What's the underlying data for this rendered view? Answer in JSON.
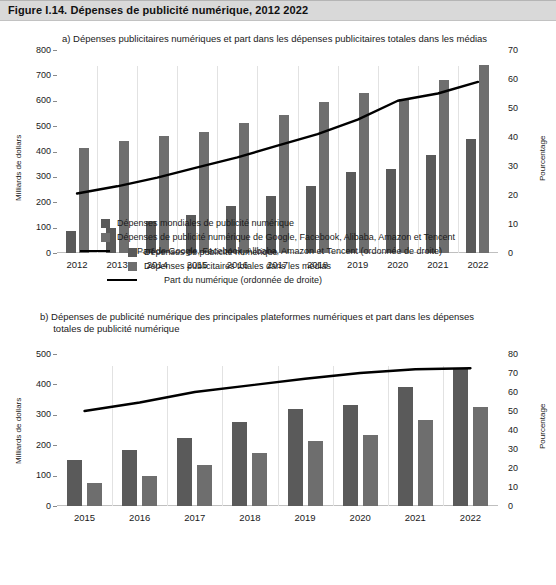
{
  "figure": {
    "title": "Figure I.14.  Dépenses de publicité numérique, 2012 2022"
  },
  "panel_a": {
    "subtitle": "a) Dépenses publicitaires numériques et part dans les dépenses publicitaires totales dans les médias",
    "y_left_title": "Milliards de dollars",
    "y_right_title": "Pourcentage",
    "legend": [
      "Dépenses de publicité numérique",
      "Dépenses publicitaires totales dans les médias",
      "Part du numérique (ordonnée de droite)"
    ]
  },
  "panel_b": {
    "subtitle": "b) Dépenses de publicité numérique des principales plateformes numériques et part dans les dépenses\n     totales de publicité numérique",
    "y_left_title": "Milliards de dollars",
    "y_right_title": "Pourcentage",
    "legend": [
      "Dépenses mondiales de publicité numérique",
      "Dépenses de publicité numérique de Google, Facebook, Alibaba, Amazon et Tencent",
      "Part de Google, Facebook, Alibaba, Amazon et Tencent (ordonnée de droite)"
    ]
  },
  "chart_data": [
    {
      "id": "panel_a",
      "type": "bar",
      "title": "a) Dépenses publicitaires numériques et part dans les dépenses publicitaires totales dans les médias",
      "xlabel": "",
      "ylabel": "Milliards de dollars",
      "y2label": "Pourcentage",
      "categories": [
        "2012",
        "2013",
        "2014",
        "2015",
        "2016",
        "2017",
        "2018",
        "2019",
        "2020",
        "2021",
        "2022"
      ],
      "ylim": [
        0,
        800
      ],
      "yticks": [
        0,
        100,
        200,
        300,
        400,
        500,
        600,
        700,
        800
      ],
      "y2lim": [
        0,
        70
      ],
      "y2ticks": [
        0,
        10,
        20,
        30,
        40,
        50,
        60,
        70
      ],
      "grid": false,
      "legend_position": "bottom",
      "series": [
        {
          "name": "Dépenses de publicité numérique",
          "type": "bar",
          "axis": "left",
          "color": "#5a5a5a",
          "values": [
            85,
            100,
            125,
            150,
            185,
            225,
            265,
            320,
            330,
            385,
            450
          ]
        },
        {
          "name": "Dépenses publicitaires totales dans les médias",
          "type": "bar",
          "axis": "left",
          "color": "#6e6e6e",
          "values": [
            415,
            440,
            462,
            478,
            512,
            545,
            597,
            632,
            605,
            680,
            740
          ]
        },
        {
          "name": "Part du numérique (ordonnée de droite)",
          "type": "line",
          "axis": "right",
          "color": "#000000",
          "values": [
            20.5,
            23.0,
            26.0,
            29.5,
            33.0,
            37.0,
            41.0,
            46.0,
            52.5,
            55.0,
            59.0
          ]
        }
      ]
    },
    {
      "id": "panel_b",
      "type": "bar",
      "title": "b) Dépenses de publicité numérique des principales plateformes numériques et part dans les dépenses totales de publicité numérique",
      "xlabel": "",
      "ylabel": "Milliards de dollars",
      "y2label": "Pourcentage",
      "categories": [
        "2015",
        "2016",
        "2017",
        "2018",
        "2019",
        "2020",
        "2021",
        "2022"
      ],
      "ylim": [
        0,
        500
      ],
      "yticks": [
        0,
        100,
        200,
        300,
        400,
        500
      ],
      "y2lim": [
        0,
        80
      ],
      "y2ticks": [
        0,
        10,
        20,
        30,
        40,
        50,
        60,
        70,
        80
      ],
      "grid": false,
      "legend_position": "bottom",
      "series": [
        {
          "name": "Dépenses mondiales de publicité numérique",
          "type": "bar",
          "axis": "left",
          "color": "#5a5a5a",
          "values": [
            152,
            184,
            225,
            275,
            318,
            332,
            393,
            450
          ]
        },
        {
          "name": "Dépenses de publicité numérique de Google, Facebook, Alibaba, Amazon et Tencent",
          "type": "bar",
          "axis": "left",
          "color": "#6e6e6e",
          "values": [
            76,
            100,
            135,
            175,
            213,
            233,
            283,
            325
          ]
        },
        {
          "name": "Part de Google, Facebook, Alibaba, Amazon et Tencent (ordonnée de droite)",
          "type": "line",
          "axis": "right",
          "color": "#000000",
          "values": [
            50.0,
            54.5,
            60.0,
            63.5,
            67.0,
            70.0,
            72.0,
            72.5
          ]
        }
      ]
    }
  ]
}
